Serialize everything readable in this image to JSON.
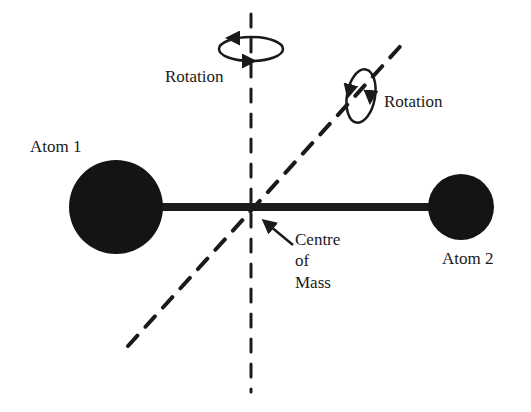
{
  "diagram": {
    "labels": {
      "atom1": "Atom 1",
      "atom2": "Atom 2",
      "rotation_vertical": "Rotation",
      "rotation_diagonal": "Rotation",
      "com_line1": "Centre",
      "com_line2": "of",
      "com_line3": "Mass"
    },
    "colors": {
      "ink": "#1a1a1a",
      "background": "#ffffff"
    },
    "geometry": {
      "atom1": {
        "cx": 116,
        "cy": 207,
        "r": 47
      },
      "atom2": {
        "cx": 461,
        "cy": 207,
        "r": 33
      },
      "bond": {
        "x1": 160,
        "x2": 430,
        "y": 207,
        "width": 8
      },
      "vertical_axis": {
        "x": 251,
        "y1": 14,
        "y2": 392
      },
      "diagonal_axis": {
        "x1": 128,
        "y1": 346,
        "x2": 406,
        "y2": 40
      },
      "centre_of_mass": {
        "x": 251,
        "y": 207
      }
    }
  }
}
